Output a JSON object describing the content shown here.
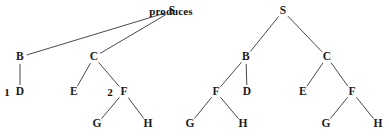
{
  "figure": {
    "caption": "produces",
    "caption_pos": {
      "x": 171,
      "y": 11
    },
    "width": 389,
    "height": 140,
    "background": "#ffffff",
    "edge_color": "#4a4a4a",
    "text_color": "#1c1c1c"
  },
  "trees": [
    {
      "name": "left-tree",
      "nodes": [
        {
          "id": "L-S",
          "label": "S",
          "x": 172,
          "y": 11
        },
        {
          "id": "L-B",
          "label": "B",
          "x": 20,
          "y": 57
        },
        {
          "id": "L-C",
          "label": "C",
          "x": 94,
          "y": 57
        },
        {
          "id": "L-D",
          "label": "D",
          "x": 20,
          "y": 92
        },
        {
          "id": "L-E",
          "label": "E",
          "x": 74,
          "y": 92
        },
        {
          "id": "L-F",
          "label": "F",
          "x": 124,
          "y": 92
        },
        {
          "id": "L-G",
          "label": "G",
          "x": 97,
          "y": 124
        },
        {
          "id": "L-H",
          "label": "H",
          "x": 148,
          "y": 124
        }
      ],
      "tokens": [
        {
          "id": "L-t1",
          "label": "1",
          "x": 7,
          "y": 92
        },
        {
          "id": "L-t2",
          "label": "2",
          "x": 110,
          "y": 92
        }
      ],
      "edges": [
        {
          "from": "L-S",
          "to": "L-B"
        },
        {
          "from": "L-S",
          "to": "L-C"
        },
        {
          "from": "L-B",
          "to": "L-D"
        },
        {
          "from": "L-C",
          "to": "L-E"
        },
        {
          "from": "L-C",
          "to": "L-F"
        },
        {
          "from": "L-F",
          "to": "L-G"
        },
        {
          "from": "L-F",
          "to": "L-H"
        }
      ]
    },
    {
      "name": "right-tree",
      "nodes": [
        {
          "id": "R-S",
          "label": "S",
          "x": 283,
          "y": 11
        },
        {
          "id": "R-B",
          "label": "B",
          "x": 246,
          "y": 57
        },
        {
          "id": "R-C",
          "label": "C",
          "x": 327,
          "y": 57
        },
        {
          "id": "R-F1",
          "label": "F",
          "x": 216,
          "y": 92
        },
        {
          "id": "R-D",
          "label": "D",
          "x": 247,
          "y": 92
        },
        {
          "id": "R-E",
          "label": "E",
          "x": 303,
          "y": 92
        },
        {
          "id": "R-F2",
          "label": "F",
          "x": 352,
          "y": 92
        },
        {
          "id": "R-G1",
          "label": "G",
          "x": 190,
          "y": 124
        },
        {
          "id": "R-H1",
          "label": "H",
          "x": 243,
          "y": 124
        },
        {
          "id": "R-G2",
          "label": "G",
          "x": 326,
          "y": 124
        },
        {
          "id": "R-H2",
          "label": "H",
          "x": 378,
          "y": 124
        }
      ],
      "tokens": [],
      "edges": [
        {
          "from": "R-S",
          "to": "R-B"
        },
        {
          "from": "R-S",
          "to": "R-C"
        },
        {
          "from": "R-B",
          "to": "R-F1"
        },
        {
          "from": "R-B",
          "to": "R-D"
        },
        {
          "from": "R-C",
          "to": "R-E"
        },
        {
          "from": "R-C",
          "to": "R-F2"
        },
        {
          "from": "R-F1",
          "to": "R-G1"
        },
        {
          "from": "R-F1",
          "to": "R-H1"
        },
        {
          "from": "R-F2",
          "to": "R-G2"
        },
        {
          "from": "R-F2",
          "to": "R-H2"
        }
      ]
    }
  ]
}
